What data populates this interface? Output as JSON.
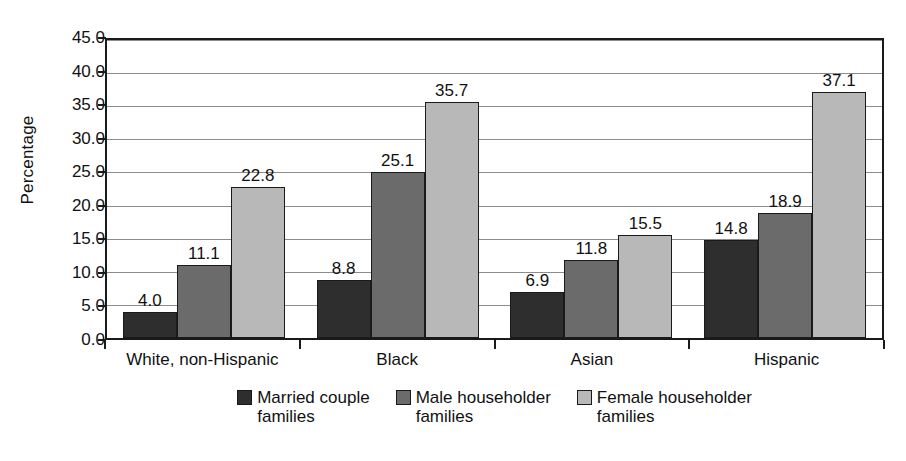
{
  "chart_data": {
    "type": "bar",
    "title": "",
    "xlabel": "",
    "ylabel": "Percentage",
    "ylim": [
      0,
      45
    ],
    "ytick_step": 5,
    "grid": true,
    "legend_position": "bottom",
    "categories": [
      "White, non-Hispanic",
      "Black",
      "Asian",
      "Hispanic"
    ],
    "ytick_labels": [
      "0.0",
      "5.0",
      "10.0",
      "15.0",
      "20.0",
      "25.0",
      "30.0",
      "35.0",
      "40.0",
      "45.0"
    ],
    "series": [
      {
        "name": "Married couple families",
        "name_line1": "Married couple",
        "name_line2": "families",
        "color": "#2e2e2e",
        "values": [
          4.0,
          8.8,
          6.9,
          14.8
        ],
        "labels": [
          "4.0",
          "8.8",
          "6.9",
          "14.8"
        ]
      },
      {
        "name": "Male householder families",
        "name_line1": "Male householder",
        "name_line2": "families",
        "color": "#6b6b6b",
        "values": [
          11.1,
          25.1,
          11.8,
          18.9
        ],
        "labels": [
          "11.1",
          "25.1",
          "11.8",
          "18.9"
        ]
      },
      {
        "name": "Female householder families",
        "name_line1": "Female householder",
        "name_line2": "families",
        "color": "#b8b8b8",
        "values": [
          22.8,
          35.7,
          15.5,
          37.1
        ],
        "labels": [
          "22.8",
          "35.7",
          "15.5",
          "37.1"
        ]
      }
    ]
  },
  "colors": {
    "axis": "#1a1a1a",
    "gridline": "#8c8c8c",
    "background": "#ffffff",
    "text": "#111111"
  }
}
